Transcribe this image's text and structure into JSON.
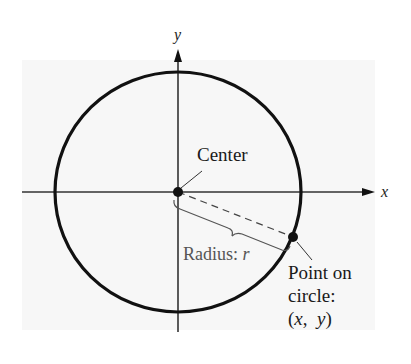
{
  "diagram": {
    "axes": {
      "x_label": "x",
      "y_label": "y"
    },
    "labels": {
      "center": "Center",
      "radius_prefix": "Radius: ",
      "radius_var": "r",
      "point_line1": "Point on",
      "point_line2": "circle:",
      "point_open": "(",
      "point_x": "x",
      "point_comma": ",  ",
      "point_y": "y",
      "point_close": ")"
    },
    "colors": {
      "background_panel": "#f7f7f7",
      "stroke": "#111111",
      "axis": "#333333",
      "radius_label": "#555555",
      "text": "#1a1a1a"
    }
  }
}
